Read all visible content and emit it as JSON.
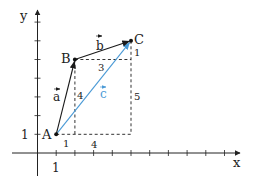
{
  "diagram": {
    "axes": {
      "x_label": "x",
      "y_label": "y",
      "x_tick_label": "1",
      "y_tick_label": "1",
      "unit_px": 18.7,
      "origin_px": [
        37.5,
        153
      ]
    },
    "points": [
      {
        "name": "A",
        "x": 1,
        "y": 1
      },
      {
        "name": "B",
        "x": 2,
        "y": 5
      },
      {
        "name": "C",
        "x": 5,
        "y": 6
      }
    ],
    "vectors": [
      {
        "name": "a",
        "label": "a",
        "from": "A",
        "to": "B",
        "color": "#1a1a1a"
      },
      {
        "name": "b",
        "label": "b",
        "from": "B",
        "to": "C",
        "color": "#1a1a1a"
      },
      {
        "name": "c",
        "label": "c",
        "from": "A",
        "to": "C",
        "color": "#4a9ad6"
      }
    ],
    "dimension_labels": {
      "a_dx": "1",
      "a_dy": "4",
      "b_dx": "3",
      "b_dy": "1",
      "c_dx": "4",
      "c_dy": "5"
    },
    "colors": {
      "axis": "#222222",
      "vector_black": "#1a1a1a",
      "vector_blue": "#4a9ad6",
      "dashed": "#333333"
    }
  }
}
